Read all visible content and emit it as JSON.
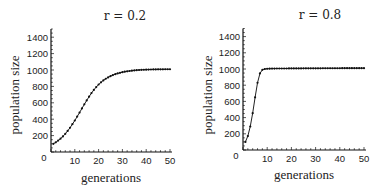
{
  "chart_data": [
    {
      "type": "line",
      "title": "r = 0.2",
      "xlabel": "generations",
      "ylabel": "population size",
      "xlim": [
        0,
        50
      ],
      "ylim": [
        0,
        1500
      ],
      "x_ticks": [
        "0",
        "10",
        "20",
        "30",
        "40",
        "50"
      ],
      "y_ticks": [
        "200",
        "400",
        "600",
        "800",
        "1000",
        "1200",
        "1400"
      ],
      "grid": false,
      "legend": "none",
      "markers": true,
      "series": [
        {
          "name": "r = 0.2",
          "x": [
            1,
            2,
            3,
            4,
            5,
            6,
            7,
            8,
            9,
            10,
            11,
            12,
            13,
            14,
            15,
            16,
            17,
            18,
            19,
            20,
            21,
            22,
            23,
            24,
            25,
            26,
            27,
            28,
            29,
            30,
            31,
            32,
            33,
            34,
            35,
            36,
            37,
            38,
            39,
            40,
            41,
            42,
            43,
            44,
            45,
            46,
            47,
            48,
            49,
            50
          ],
          "values": [
            100,
            118,
            139,
            163,
            190,
            222,
            257,
            296,
            339,
            384,
            432,
            481,
            531,
            581,
            629,
            675,
            718,
            757,
            792,
            823,
            850,
            873,
            893,
            910,
            925,
            938,
            949,
            958,
            966,
            973,
            979,
            984,
            988,
            992,
            995,
            998,
            1000,
            1002,
            1003,
            1004,
            1005,
            1006,
            1007,
            1007,
            1008,
            1008,
            1008,
            1009,
            1009,
            1009
          ]
        }
      ]
    },
    {
      "type": "line",
      "title": "r = 0.8",
      "xlabel": "generations",
      "ylabel": "population size",
      "xlim": [
        0,
        50
      ],
      "ylim": [
        0,
        1500
      ],
      "x_ticks": [
        "0",
        "10",
        "20",
        "30",
        "40",
        "50"
      ],
      "y_ticks": [
        "200",
        "400",
        "600",
        "800",
        "1000",
        "1200",
        "1400"
      ],
      "grid": false,
      "legend": "none",
      "markers": true,
      "series": [
        {
          "name": "r = 0.8",
          "x": [
            1,
            2,
            3,
            4,
            5,
            6,
            7,
            8,
            9,
            10,
            11,
            12,
            13,
            14,
            15,
            16,
            17,
            18,
            19,
            20,
            21,
            22,
            23,
            24,
            25,
            26,
            27,
            28,
            29,
            30,
            31,
            32,
            33,
            34,
            35,
            36,
            37,
            38,
            39,
            40,
            41,
            42,
            43,
            44,
            45,
            46,
            47,
            48,
            49,
            50
          ],
          "values": [
            100,
            172,
            290,
            455,
            650,
            830,
            945,
            990,
            1000,
            1003,
            1004,
            1005,
            1005,
            1006,
            1006,
            1006,
            1006,
            1006,
            1007,
            1007,
            1007,
            1007,
            1007,
            1007,
            1008,
            1008,
            1008,
            1008,
            1008,
            1008,
            1008,
            1008,
            1009,
            1009,
            1009,
            1009,
            1009,
            1009,
            1009,
            1009,
            1010,
            1010,
            1010,
            1010,
            1010,
            1010,
            1010,
            1010,
            1010,
            1010
          ]
        }
      ]
    }
  ],
  "origin_label": "0"
}
